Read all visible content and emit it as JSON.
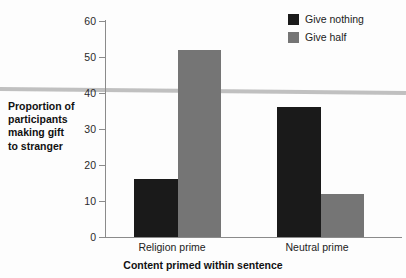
{
  "chart_data": {
    "type": "bar",
    "title": "",
    "subtitle": "",
    "categories": [
      "Religion prime",
      "Neutral prime"
    ],
    "series": [
      {
        "name": "Give nothing",
        "values": [
          16,
          36
        ],
        "color": "#1a1a1a"
      },
      {
        "name": "Give half",
        "values": [
          52,
          12
        ],
        "color": "#757575"
      }
    ],
    "xlabel": "Content primed within sentence",
    "ylabel": "Proportion of participants making gift to stranger",
    "ylim": [
      0,
      60
    ],
    "yticks": [
      0,
      10,
      20,
      30,
      40,
      50,
      60
    ],
    "ytick_labels": [
      "0",
      "10",
      "20",
      "30",
      "40",
      "50",
      "60"
    ],
    "grid": false,
    "legend_position": "top-right",
    "annotations": [
      "horizontal-scan-line-artifact"
    ]
  },
  "axes": {
    "y_title_lines": [
      "Proportion of",
      "participants",
      "making gift",
      "to stranger"
    ],
    "x_title": "Content primed within sentence"
  },
  "legend": {
    "entries": [
      {
        "label": "Give nothing",
        "color": "#1a1a1a"
      },
      {
        "label": "Give half",
        "color": "#757575"
      }
    ]
  },
  "colors": {
    "background": "#fdfdfd",
    "axis": "#8b8b8b",
    "text": "#222222",
    "give_nothing": "#1a1a1a",
    "give_half": "#757575",
    "artifact_line": "#bdbdbd"
  }
}
